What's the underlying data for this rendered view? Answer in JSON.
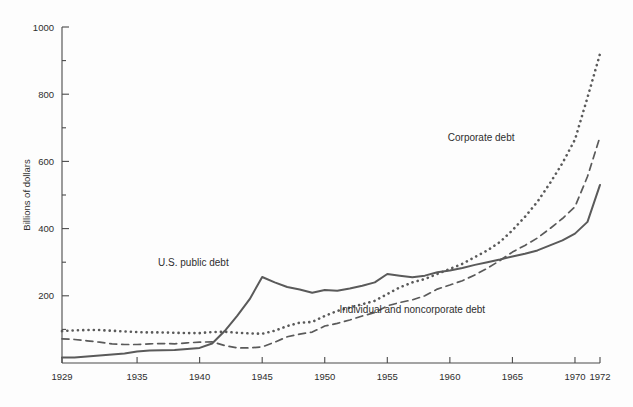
{
  "chart_data": {
    "type": "line",
    "title": "",
    "xlabel": "",
    "ylabel": "Billions of dollars",
    "xlim": [
      1929,
      1972
    ],
    "ylim": [
      0,
      1000
    ],
    "grid": false,
    "legend_position": "inline-annotations",
    "x_ticks": [
      1929,
      1935,
      1940,
      1945,
      1950,
      1955,
      1960,
      1965,
      1970,
      1972
    ],
    "x_tick_labels": [
      "1929",
      "1935",
      "1940",
      "1945",
      "1950",
      "1955",
      "1960",
      "1965",
      "1970",
      "1972"
    ],
    "y_ticks": [
      0,
      100,
      200,
      300,
      400,
      500,
      600,
      700,
      800,
      900,
      1000
    ],
    "y_tick_labels": [
      "",
      "",
      "200",
      "",
      "400",
      "",
      "600",
      "",
      "800",
      "",
      "1000"
    ],
    "y_major_ticks": [
      200,
      400,
      600,
      800,
      1000
    ],
    "annotations": [
      {
        "text": "U.S. public debt",
        "x": 1939.5,
        "y": 290
      },
      {
        "text": "Corporate debt",
        "x": 1962.5,
        "y": 660
      },
      {
        "text": "Individual and noncorporate debt",
        "x": 1957.0,
        "y": 148
      }
    ],
    "series": [
      {
        "name": "U.S. public debt",
        "style": "solid",
        "color": "#5a5a5a",
        "x": [
          1929,
          1930,
          1931,
          1932,
          1933,
          1934,
          1935,
          1936,
          1937,
          1938,
          1939,
          1940,
          1941,
          1942,
          1943,
          1944,
          1945,
          1946,
          1947,
          1948,
          1949,
          1950,
          1951,
          1952,
          1953,
          1954,
          1955,
          1956,
          1957,
          1958,
          1959,
          1960,
          1961,
          1962,
          1963,
          1964,
          1965,
          1966,
          1967,
          1968,
          1969,
          1970,
          1971,
          1972
        ],
        "values": [
          16,
          16,
          19,
          22,
          25,
          28,
          34,
          37,
          38,
          39,
          42,
          45,
          58,
          95,
          140,
          190,
          256,
          240,
          226,
          219,
          209,
          217,
          215,
          222,
          230,
          240,
          265,
          260,
          255,
          260,
          270,
          275,
          283,
          292,
          300,
          308,
          317,
          325,
          335,
          350,
          365,
          385,
          420,
          530
        ]
      },
      {
        "name": "Corporate debt",
        "style": "dotted",
        "color": "#5a5a5a",
        "x": [
          1929,
          1930,
          1931,
          1932,
          1933,
          1934,
          1935,
          1936,
          1937,
          1938,
          1939,
          1940,
          1941,
          1942,
          1943,
          1944,
          1945,
          1946,
          1947,
          1948,
          1949,
          1950,
          1951,
          1952,
          1953,
          1954,
          1955,
          1956,
          1957,
          1958,
          1959,
          1960,
          1961,
          1962,
          1963,
          1964,
          1965,
          1966,
          1967,
          1968,
          1969,
          1970,
          1971,
          1972
        ],
        "values": [
          95,
          97,
          98,
          98,
          96,
          94,
          92,
          91,
          91,
          90,
          89,
          89,
          92,
          93,
          90,
          88,
          87,
          96,
          110,
          120,
          122,
          140,
          155,
          165,
          175,
          185,
          205,
          225,
          240,
          250,
          265,
          280,
          295,
          315,
          335,
          360,
          395,
          435,
          480,
          535,
          595,
          665,
          790,
          920
        ]
      },
      {
        "name": "Individual and noncorporate debt",
        "style": "dashed",
        "color": "#5a5a5a",
        "x": [
          1929,
          1930,
          1931,
          1932,
          1933,
          1934,
          1935,
          1936,
          1937,
          1938,
          1939,
          1940,
          1941,
          1942,
          1943,
          1944,
          1945,
          1946,
          1947,
          1948,
          1949,
          1950,
          1951,
          1952,
          1953,
          1954,
          1955,
          1956,
          1957,
          1958,
          1959,
          1960,
          1961,
          1962,
          1963,
          1964,
          1965,
          1966,
          1967,
          1968,
          1969,
          1970,
          1971,
          1972
        ],
        "values": [
          72,
          70,
          66,
          62,
          57,
          55,
          55,
          57,
          58,
          57,
          60,
          62,
          63,
          52,
          45,
          45,
          48,
          62,
          78,
          86,
          92,
          110,
          118,
          128,
          140,
          150,
          170,
          180,
          188,
          200,
          220,
          232,
          245,
          262,
          282,
          305,
          330,
          350,
          372,
          400,
          430,
          465,
          555,
          673
        ]
      }
    ]
  }
}
